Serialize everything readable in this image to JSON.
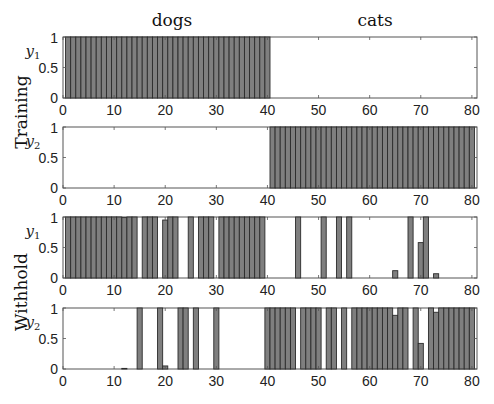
{
  "chart_data": {
    "type": "bar",
    "column_titles": [
      "dogs",
      "cats"
    ],
    "row_labels": [
      "Training",
      "Withhold"
    ],
    "x": [
      1,
      2,
      3,
      4,
      5,
      6,
      7,
      8,
      9,
      10,
      11,
      12,
      13,
      14,
      15,
      16,
      17,
      18,
      19,
      20,
      21,
      22,
      23,
      24,
      25,
      26,
      27,
      28,
      29,
      30,
      31,
      32,
      33,
      34,
      35,
      36,
      37,
      38,
      39,
      40,
      41,
      42,
      43,
      44,
      45,
      46,
      47,
      48,
      49,
      50,
      51,
      52,
      53,
      54,
      55,
      56,
      57,
      58,
      59,
      60,
      61,
      62,
      63,
      64,
      65,
      66,
      67,
      68,
      69,
      70,
      71,
      72,
      73,
      74,
      75,
      76,
      77,
      78,
      79,
      80
    ],
    "xlim": [
      0,
      81
    ],
    "xticks": [
      "0",
      "10",
      "20",
      "30",
      "40",
      "50",
      "60",
      "70",
      "80"
    ],
    "xtick_values": [
      0,
      10,
      20,
      30,
      40,
      50,
      60,
      70,
      80
    ],
    "ylim": [
      0,
      1
    ],
    "yticks": [
      "0",
      "0.5",
      "1"
    ],
    "ytick_values": [
      0,
      0.5,
      1
    ],
    "bar_color": "#7f7f7f",
    "edge_color": "#2b2b2b",
    "panels": [
      {
        "name": "training-y1",
        "row": "Training",
        "ylabel_main": "y",
        "ylabel_sub": "1",
        "values": [
          1,
          1,
          1,
          1,
          1,
          1,
          1,
          1,
          1,
          1,
          1,
          1,
          1,
          1,
          1,
          1,
          1,
          1,
          1,
          1,
          1,
          1,
          1,
          1,
          1,
          1,
          1,
          1,
          1,
          1,
          1,
          1,
          1,
          1,
          1,
          1,
          1,
          1,
          1,
          1,
          0,
          0,
          0,
          0,
          0,
          0,
          0,
          0,
          0,
          0,
          0,
          0,
          0,
          0,
          0,
          0,
          0,
          0,
          0,
          0,
          0,
          0,
          0,
          0,
          0,
          0,
          0,
          0,
          0,
          0,
          0,
          0,
          0,
          0,
          0,
          0,
          0,
          0,
          0,
          0
        ]
      },
      {
        "name": "training-y2",
        "row": "Training",
        "ylabel_main": "y",
        "ylabel_sub": "2",
        "values": [
          0,
          0,
          0,
          0,
          0,
          0,
          0,
          0,
          0,
          0,
          0,
          0,
          0,
          0,
          0,
          0,
          0,
          0,
          0,
          0,
          0,
          0,
          0,
          0,
          0,
          0,
          0,
          0,
          0,
          0,
          0,
          0,
          0,
          0,
          0,
          0,
          0,
          0,
          0,
          0,
          1,
          1,
          1,
          1,
          1,
          1,
          1,
          1,
          1,
          1,
          1,
          1,
          1,
          1,
          1,
          1,
          1,
          1,
          1,
          1,
          1,
          1,
          1,
          1,
          1,
          1,
          1,
          1,
          1,
          1,
          1,
          1,
          1,
          1,
          1,
          1,
          1,
          1,
          1,
          1
        ]
      },
      {
        "name": "withhold-y1",
        "row": "Withhold",
        "ylabel_main": "y",
        "ylabel_sub": "1",
        "values": [
          1,
          1,
          1,
          1,
          1,
          1,
          1,
          1,
          1,
          1,
          1,
          0.99,
          1,
          1,
          0,
          1,
          1,
          1,
          0,
          0.95,
          1,
          1,
          0,
          0,
          1,
          0,
          1,
          1,
          1,
          0,
          1,
          1,
          1,
          1,
          1,
          1,
          1,
          1,
          1,
          0,
          0,
          0,
          0,
          0,
          0,
          1,
          0,
          0,
          0,
          0,
          1,
          0,
          0,
          1,
          0,
          1,
          0,
          0,
          0,
          0,
          0,
          0,
          0,
          0,
          0.12,
          0,
          0,
          1,
          0,
          0.58,
          1,
          0,
          0.07,
          0,
          0,
          0,
          0,
          0,
          0,
          0
        ]
      },
      {
        "name": "withhold-y2",
        "row": "Withhold",
        "ylabel_main": "y",
        "ylabel_sub": "2",
        "values": [
          0,
          0,
          0,
          0,
          0,
          0,
          0,
          0,
          0,
          0,
          0,
          0.01,
          0,
          0,
          1,
          0,
          0,
          0,
          1,
          0.05,
          0,
          0,
          1,
          1,
          0,
          1,
          0,
          0,
          0,
          1,
          0,
          0,
          0,
          0,
          0,
          0,
          0,
          0,
          0,
          1,
          1,
          1,
          1,
          1,
          1,
          0,
          1,
          1,
          1,
          1,
          0,
          1,
          1,
          0,
          1,
          0,
          1,
          1,
          1,
          1,
          1,
          1,
          1,
          1,
          0.88,
          1,
          1,
          0,
          1,
          0.42,
          0,
          1,
          0.93,
          1,
          1,
          1,
          1,
          1,
          1,
          1
        ]
      }
    ]
  }
}
